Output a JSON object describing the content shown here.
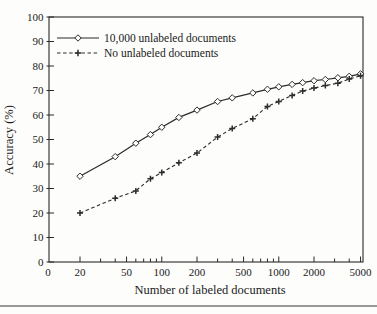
{
  "chart_data": {
    "type": "line",
    "title": "",
    "xlabel": "Number of labeled documents",
    "ylabel": "Accuracy (%)",
    "x_scale": "log",
    "x_origin_label": "0",
    "xlim_log": [
      20,
      5500
    ],
    "ylim": [
      0,
      100
    ],
    "grid": "off",
    "legend_position": "top-left-inside",
    "x_major_ticks": [
      20,
      50,
      100,
      200,
      500,
      1000,
      2000,
      5000
    ],
    "x_major_tick_labels": [
      "20",
      "50",
      "100",
      "200",
      "500",
      "1000",
      "2000",
      "5000"
    ],
    "x_minor_ticks": [
      30,
      40,
      60,
      70,
      80,
      90,
      300,
      400,
      600,
      700,
      800,
      900,
      3000,
      4000
    ],
    "y_ticks": [
      0,
      10,
      20,
      30,
      40,
      50,
      60,
      70,
      80,
      90,
      100
    ],
    "y_tick_labels": [
      "0",
      "10",
      "20",
      "30",
      "40",
      "50",
      "60",
      "70",
      "80",
      "90",
      "100"
    ],
    "series": [
      {
        "name": "10,000 unlabeled documents",
        "line": "solid",
        "marker": "diamond",
        "x": [
          20,
          40,
          60,
          80,
          100,
          140,
          200,
          300,
          400,
          600,
          800,
          1000,
          1300,
          1600,
          2000,
          2500,
          3200,
          4000,
          5000
        ],
        "y": [
          35,
          43,
          48.5,
          52,
          55,
          59,
          62,
          65.5,
          67,
          69,
          70.5,
          71.5,
          72.5,
          73.2,
          74,
          74.5,
          75.2,
          75.8,
          76.8
        ]
      },
      {
        "name": "No unlabeled documents",
        "line": "dashed",
        "marker": "plus",
        "x": [
          20,
          40,
          60,
          80,
          100,
          140,
          200,
          300,
          400,
          600,
          800,
          1000,
          1300,
          1600,
          2000,
          2500,
          3200,
          4000,
          5000
        ],
        "y": [
          20,
          26,
          29,
          34,
          36.5,
          40.5,
          44.5,
          51,
          54.5,
          58.5,
          63.5,
          65.5,
          68,
          69.8,
          71,
          72,
          73,
          74.7,
          76
        ]
      }
    ],
    "colors": {
      "line": "#2b2b2b",
      "text": "#1a1a1a",
      "background": "#fdfdfc",
      "divider": "#999999"
    }
  }
}
